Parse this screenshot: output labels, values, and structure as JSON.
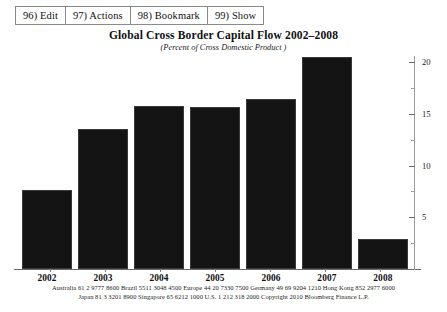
{
  "toolbar": {
    "buttons": [
      {
        "label": "96) Edit",
        "name": "edit"
      },
      {
        "label": "97) Actions",
        "name": "actions"
      },
      {
        "label": "98) Bookmark",
        "name": "bookmark"
      },
      {
        "label": "99) Show",
        "name": "show"
      }
    ]
  },
  "chart_data": {
    "type": "bar",
    "title": "Global Cross Border Capital Flow 2002–2008",
    "subtitle": "(Percent of Cross Domestic Product )",
    "xlabel": "",
    "ylabel": "",
    "categories": [
      "2002",
      "2003",
      "2004",
      "2005",
      "2006",
      "2007",
      "2008"
    ],
    "values": [
      7.6,
      13.5,
      15.8,
      15.7,
      16.4,
      20.5,
      2.9
    ],
    "ylim": [
      0,
      20.6
    ],
    "yticks": [
      5,
      10,
      15,
      20
    ],
    "ytick_labels": [
      "5",
      "10",
      "15",
      "20"
    ],
    "yminor_ticks": [
      2.5,
      7.5,
      12.5,
      17.5
    ],
    "grid": false,
    "legend": null,
    "bar_color": "#141414",
    "axis_position": "right"
  },
  "footer": {
    "line1": [
      "Australia",
      "61  2 9777 8600",
      "Brazil",
      "5511 3048 4500",
      "Europe",
      "44 20 7330 7500",
      "Germany",
      "49 69 9204 1210",
      "Hong Kong",
      "852 2977 6000"
    ],
    "line2": [
      "Japan",
      "81 3  3201  8900",
      "Singapore",
      "65 6212 1000",
      "U.S.",
      "1 212  318  2000",
      "Copyright 2010 Bloomberg Finance L.P."
    ],
    "line1_text": "Australia   61  2 9777 8600  Brazil   5511 3048 4500  Europe 44 20 7330 7500  Germany 49 69 9204 1210  Hong Kong 852 2977 6000",
    "line2_text": "Japan 81 3  3201  8900            Singapore  65 6212 1000        U.S.  1 212  318  2000            Copyright 2010 Bloomberg Finance L.P."
  }
}
